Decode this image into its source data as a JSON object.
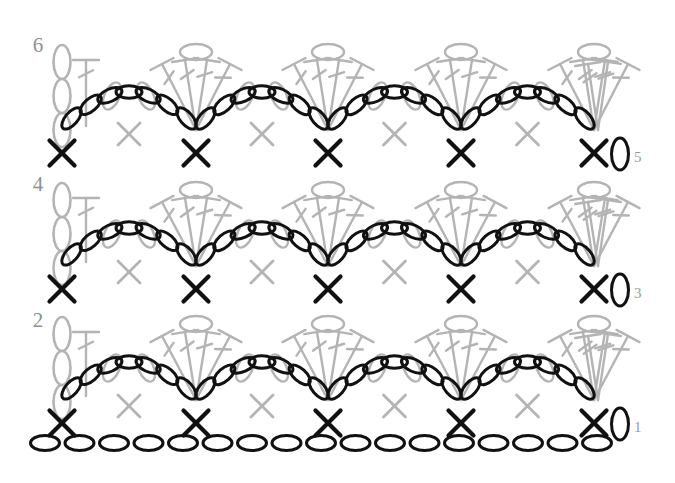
{
  "diagram": {
    "type": "crochet-stitch-diagram",
    "colors": {
      "active_row": "#111111",
      "previous_row": "#b4b4b4",
      "label_gray": "#8f8f8f",
      "background": "#ffffff"
    },
    "canvas": {
      "width": 675,
      "height": 483
    }
  },
  "legend_symbols": [
    {
      "name": "chain",
      "glyph": "oval",
      "meaning": "chain stitch"
    },
    {
      "name": "single-crochet",
      "glyph": "X",
      "meaning": "single crochet"
    },
    {
      "name": "double-crochet",
      "glyph": "stem-with-bar",
      "meaning": "double crochet"
    }
  ],
  "row_labels": {
    "left": [
      {
        "text": "6",
        "x": 38,
        "y": 52
      },
      {
        "text": "4",
        "x": 38,
        "y": 191
      },
      {
        "text": "2",
        "x": 38,
        "y": 327
      }
    ],
    "right": [
      {
        "text": "5",
        "x": 634,
        "y": 162,
        "chain_x": 620,
        "chain_y": 154
      },
      {
        "text": "3",
        "x": 634,
        "y": 298,
        "chain_x": 620,
        "chain_y": 290
      },
      {
        "text": "1",
        "x": 634,
        "y": 432,
        "chain_x": 620,
        "chain_y": 424
      }
    ]
  },
  "chart_data": {
    "type": "diagram",
    "repeat_count": 4,
    "unit_width": 133,
    "foundation_chain": {
      "count": 17,
      "y": 443,
      "x_start": 45,
      "spacing": 34.5
    },
    "bands": [
      {
        "row_pair": "1-2",
        "sc_y": 423,
        "arch_y": 398,
        "shell_top_y": 322,
        "shell_base_y": 400,
        "label_left": "2",
        "label_right": "1"
      },
      {
        "row_pair": "3-4",
        "sc_y": 289,
        "arch_y": 264,
        "shell_top_y": 188,
        "shell_base_y": 266,
        "label_left": "4",
        "label_right": "3"
      },
      {
        "row_pair": "5-6",
        "sc_y": 153,
        "arch_y": 128,
        "shell_top_y": 50,
        "shell_base_y": 130,
        "label_left": "6",
        "label_right": "5"
      }
    ],
    "sc_positions_x": [
      62,
      196,
      328,
      461,
      594
    ],
    "arch_chain_per_arch": 7,
    "shell_stems_per_shell": 4,
    "turning_chain_count": 3
  }
}
